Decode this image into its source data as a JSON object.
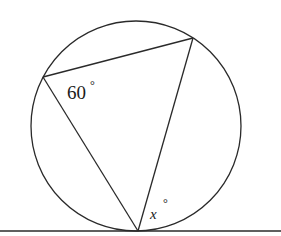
{
  "diagram": {
    "type": "circle-geometry",
    "circle": {
      "cx": 136,
      "cy": 126,
      "r": 105
    },
    "tangent_line": {
      "x1": 0,
      "y1": 231,
      "x2": 281,
      "y2": 231
    },
    "vertices": {
      "left": {
        "x": 43,
        "y": 77
      },
      "top_right": {
        "x": 193,
        "y": 38
      },
      "bottom": {
        "x": 138,
        "y": 231
      }
    },
    "labels": {
      "angle_left": "60",
      "angle_left_degree": "°",
      "angle_tangent_var": "x",
      "angle_tangent_degree": "°"
    },
    "colors": {
      "stroke": "#2a2a2a",
      "background": "#ffffff"
    }
  }
}
